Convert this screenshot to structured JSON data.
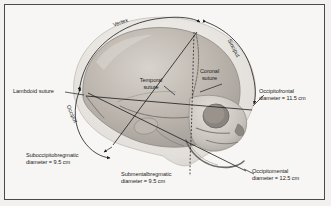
{
  "figure": {
    "background_color": "#f2f1ef",
    "panel_color": "#f7f6f4",
    "border_color": "#4a4a4a",
    "ink_color": "#1c1c1c",
    "bone_light": "#e9e6e1",
    "bone_mid": "#c9c4bd",
    "bone_dark": "#9d9792",
    "cranium_shade": "#b8b2ab"
  },
  "landmark_arcs": [
    {
      "id": "vertex",
      "label": "Vertex",
      "position": "top"
    },
    {
      "id": "sinciput",
      "label": "Sinciput",
      "position": "upper-right"
    },
    {
      "id": "occiput",
      "label": "Occiput",
      "position": "lower-left"
    }
  ],
  "sutures": [
    {
      "id": "lambdoid",
      "label": "Lambdoid suture",
      "position": "left"
    },
    {
      "id": "temporal",
      "label": "Temporal\nsuture",
      "line1": "Temporal",
      "line2": "suture",
      "position": "center"
    },
    {
      "id": "coronal",
      "label": "Coronal\nsuture",
      "line1": "Coronal",
      "line2": "suture",
      "position": "center-right"
    }
  ],
  "diameters": [
    {
      "id": "occipitofrontal",
      "name": "Occipitofrontal",
      "line1": "Occipitofrontal",
      "line2": "diameter = 11.5 cm",
      "value_cm": 11.5,
      "position": "right"
    },
    {
      "id": "occipitomental",
      "name": "Occipitomental",
      "line1": "Occipitomental",
      "line2": "diameter = 12.5 cm",
      "value_cm": 12.5,
      "position": "bottom-right"
    },
    {
      "id": "suboccipitobregmatic",
      "name": "Suboccipitobregmatic",
      "line1": "Suboccipitobregmatic",
      "line2": "diameter = 9.5 cm",
      "value_cm": 9.5,
      "position": "bottom-left"
    },
    {
      "id": "submentalbregmatic",
      "name": "Submentalbregmatic",
      "line1": "Submentalbregmatic",
      "line2": "diameter = 9.5 cm",
      "value_cm": 9.5,
      "position": "bottom-center"
    }
  ]
}
